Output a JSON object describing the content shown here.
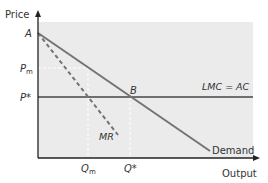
{
  "diagram": {
    "type": "monopoly-vs-competition-economics",
    "colors": {
      "panel": "#ebebeb",
      "curve": "#737373",
      "lmc": "#6f6f6f",
      "axis": "#222222",
      "guide": "#ffffff",
      "text": "#333333"
    },
    "axes": {
      "y_label": "Price",
      "x_label": "Output"
    },
    "points": {
      "A": "A",
      "B": "B"
    },
    "price_labels": {
      "pm_main": "P",
      "pm_sub": "m",
      "pstar": "P*"
    },
    "quantity_labels": {
      "qm_main": "Q",
      "qm_sub": "m",
      "qstar": "Q*"
    },
    "curves": {
      "lmc_ac": "LMC = AC",
      "mr": "MR",
      "demand": "Demand"
    }
  }
}
